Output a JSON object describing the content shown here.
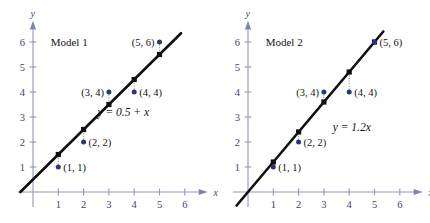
{
  "figure": {
    "background_color": "#ffffff",
    "width": 430,
    "height": 223,
    "axis_color": "#9097bd",
    "point_color": "#2a3580",
    "line_color": "#101010"
  },
  "chart_data": [
    {
      "type": "scatter",
      "title": "Model 1",
      "xlabel": "x",
      "ylabel": "y",
      "xlim": [
        -0.6,
        6.9
      ],
      "ylim": [
        -0.6,
        6.8
      ],
      "xticks": [
        "1",
        "2",
        "3",
        "4",
        "5",
        "6"
      ],
      "yticks": [
        "1",
        "2",
        "3",
        "4",
        "5",
        "6"
      ],
      "xtick_values": [
        1,
        2,
        3,
        4,
        5,
        6
      ],
      "ytick_values": [
        1,
        2,
        3,
        4,
        5,
        6
      ],
      "grid": false,
      "x": [
        1,
        2,
        3,
        4,
        5
      ],
      "y": [
        1,
        2,
        4,
        4,
        6
      ],
      "point_labels": [
        "(1, 1)",
        "(2, 2)",
        "(3, 4)",
        "(4, 4)",
        "(5, 6)"
      ],
      "label_positions": [
        "right",
        "right",
        "left",
        "right",
        "left"
      ],
      "fit_label": "y = 0.5 + x",
      "fit_intercept": 0.5,
      "fit_slope": 1.0,
      "fitted_values": [
        1.5,
        2.5,
        3.5,
        4.5,
        5.5
      ],
      "residuals": [
        -0.5,
        -0.5,
        0.5,
        -0.5,
        0.5
      ],
      "fit_line_x_range": [
        -0.5,
        5.85
      ],
      "legend_position": "none"
    },
    {
      "type": "scatter",
      "title": "Model 2",
      "xlabel": "x",
      "ylabel": "y",
      "xlim": [
        -0.6,
        6.9
      ],
      "ylim": [
        -0.6,
        6.8
      ],
      "xticks": [
        "1",
        "2",
        "3",
        "4",
        "5",
        "6"
      ],
      "yticks": [
        "1",
        "2",
        "3",
        "4",
        "5",
        "6"
      ],
      "xtick_values": [
        1,
        2,
        3,
        4,
        5,
        6
      ],
      "ytick_values": [
        1,
        2,
        3,
        4,
        5,
        6
      ],
      "grid": false,
      "x": [
        1,
        2,
        3,
        4,
        5
      ],
      "y": [
        1,
        2,
        4,
        4,
        6
      ],
      "point_labels": [
        "(1, 1)",
        "(2, 2)",
        "(3, 4)",
        "(4, 4)",
        "(5, 6)"
      ],
      "label_positions": [
        "right",
        "right",
        "left",
        "right",
        "right"
      ],
      "fit_label": "y = 1.2x",
      "fit_intercept": 0.0,
      "fit_slope": 1.2,
      "fitted_values": [
        1.2,
        2.4,
        3.6,
        4.8,
        6.0
      ],
      "residuals": [
        -0.2,
        -0.4,
        0.4,
        -0.8,
        0.0
      ],
      "fit_line_x_range": [
        -0.45,
        5.35
      ],
      "legend_position": "none"
    }
  ]
}
